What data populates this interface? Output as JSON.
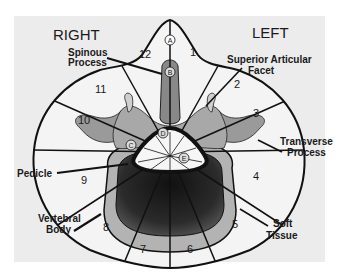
{
  "figure": {
    "orientation": {
      "right_label": "RIGHT",
      "left_label": "LEFT"
    },
    "anatomy_labels": {
      "spinous_process": [
        "Spinous",
        "Process"
      ],
      "superior_articular_facet": [
        "Superior Articular",
        "Facet"
      ],
      "transverse_process": [
        "Transverse",
        "Process"
      ],
      "pedicle": [
        "Pedicle"
      ],
      "vertebral_body": [
        "Vertebral",
        "Body"
      ],
      "soft_tissue": [
        "Soft",
        "Tissue"
      ]
    },
    "zones": [
      "1",
      "2",
      "3",
      "4",
      "5",
      "6",
      "7",
      "8",
      "9",
      "10",
      "11",
      "12"
    ],
    "points": [
      "A",
      "B",
      "C",
      "D",
      "E"
    ],
    "colors": {
      "panel": "#ececec",
      "outline": "#111111",
      "bone_light": "#b8b8b8",
      "bone_mid": "#8a8a8a",
      "body_dark": "#2a2a2a",
      "soft_tissue": "#f4f4f4"
    }
  }
}
